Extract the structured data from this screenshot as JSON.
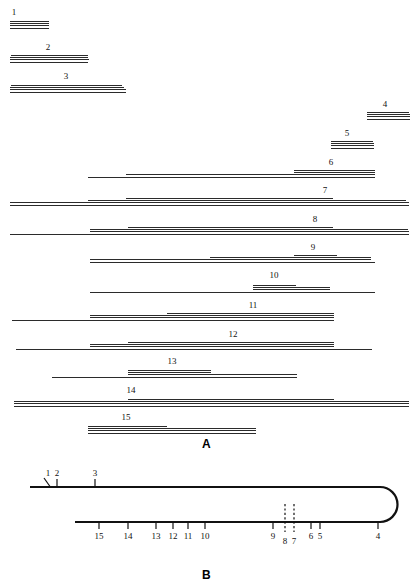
{
  "figure": {
    "panels": [
      {
        "letter": "A",
        "caption_x": 207,
        "caption_y": 437
      },
      {
        "letter": "B",
        "caption_x": 207,
        "caption_y": 568
      }
    ]
  },
  "chart_data": {
    "type": "diagram",
    "xlabel": "",
    "ylabel": "",
    "grid": false,
    "legend": "none",
    "panel_a": {
      "description": "Fifteen restriction fragments, each drawn as a group of four closely spaced horizontal rules of slightly different lengths; the fragment number is printed above each group.",
      "line_color": "#2b2b2b",
      "lines_per_band": 4,
      "bands": [
        {
          "id": "1",
          "label": "1",
          "y": 21,
          "label_x": 14,
          "label_y": 8,
          "rules": [
            {
              "x1": 10,
              "x2": 49
            },
            {
              "x1": 10,
              "x2": 49
            },
            {
              "x1": 10,
              "x2": 49
            },
            {
              "x1": 10,
              "x2": 49
            }
          ]
        },
        {
          "id": "2",
          "label": "2",
          "y": 55,
          "label_x": 48,
          "label_y": 43,
          "rules": [
            {
              "x1": 11,
              "x2": 88
            },
            {
              "x1": 10,
              "x2": 88
            },
            {
              "x1": 10,
              "x2": 89
            },
            {
              "x1": 10,
              "x2": 88
            }
          ]
        },
        {
          "id": "3",
          "label": "3",
          "y": 85,
          "label_x": 66,
          "label_y": 72,
          "rules": [
            {
              "x1": 11,
              "x2": 122
            },
            {
              "x1": 10,
              "x2": 124
            },
            {
              "x1": 10,
              "x2": 126
            },
            {
              "x1": 10,
              "x2": 126
            }
          ]
        },
        {
          "id": "4",
          "label": "4",
          "y": 112,
          "label_x": 385,
          "label_y": 100,
          "rules": [
            {
              "x1": 367,
              "x2": 409
            },
            {
              "x1": 367,
              "x2": 410
            },
            {
              "x1": 367,
              "x2": 410
            },
            {
              "x1": 367,
              "x2": 410
            }
          ]
        },
        {
          "id": "5",
          "label": "5",
          "y": 141,
          "label_x": 347,
          "label_y": 129,
          "rules": [
            {
              "x1": 331,
              "x2": 373
            },
            {
              "x1": 331,
              "x2": 374
            },
            {
              "x1": 331,
              "x2": 374
            },
            {
              "x1": 331,
              "x2": 374
            }
          ]
        },
        {
          "id": "6",
          "label": "6",
          "y": 170,
          "label_x": 331,
          "label_y": 158,
          "rules": [
            {
              "x1": 294,
              "x2": 375
            },
            {
              "x1": 294,
              "x2": 375
            },
            {
              "x1": 126,
              "x2": 375
            },
            {
              "x1": 88,
              "x2": 375
            }
          ]
        },
        {
          "id": "7",
          "label": "7",
          "y": 198,
          "label_x": 325,
          "label_y": 186,
          "rules": [
            {
              "x1": 126,
              "x2": 333
            },
            {
              "x1": 88,
              "x2": 406
            },
            {
              "x1": 10,
              "x2": 409
            },
            {
              "x1": 10,
              "x2": 409
            }
          ]
        },
        {
          "id": "8",
          "label": "8",
          "y": 227,
          "label_x": 315,
          "label_y": 215,
          "rules": [
            {
              "x1": 128,
              "x2": 333
            },
            {
              "x1": 90,
              "x2": 408
            },
            {
              "x1": 90,
              "x2": 409
            },
            {
              "x1": 10,
              "x2": 409
            }
          ]
        },
        {
          "id": "9",
          "label": "9",
          "y": 255,
          "label_x": 313,
          "label_y": 243,
          "rules": [
            {
              "x1": 294,
              "x2": 337
            },
            {
              "x1": 210,
              "x2": 371
            },
            {
              "x1": 90,
              "x2": 371
            },
            {
              "x1": 90,
              "x2": 375
            }
          ]
        },
        {
          "id": "10",
          "label": "10",
          "y": 285,
          "label_x": 274,
          "label_y": 271,
          "rules": [
            {
              "x1": 253,
              "x2": 296
            },
            {
              "x1": 253,
              "x2": 330
            },
            {
              "x1": 253,
              "x2": 330
            },
            {
              "x1": 90,
              "x2": 375
            }
          ]
        },
        {
          "id": "11",
          "label": "11",
          "y": 313,
          "label_x": 253,
          "label_y": 301,
          "rules": [
            {
              "x1": 167,
              "x2": 334
            },
            {
              "x1": 90,
              "x2": 334
            },
            {
              "x1": 90,
              "x2": 334
            },
            {
              "x1": 12,
              "x2": 334
            }
          ]
        },
        {
          "id": "12",
          "label": "12",
          "y": 342,
          "label_x": 233,
          "label_y": 330,
          "rules": [
            {
              "x1": 128,
              "x2": 334
            },
            {
              "x1": 90,
              "x2": 334
            },
            {
              "x1": 90,
              "x2": 334
            },
            {
              "x1": 16,
              "x2": 372
            }
          ]
        },
        {
          "id": "13",
          "label": "13",
          "y": 370,
          "label_x": 172,
          "label_y": 357,
          "rules": [
            {
              "x1": 128,
              "x2": 211
            },
            {
              "x1": 128,
              "x2": 211
            },
            {
              "x1": 128,
              "x2": 297
            },
            {
              "x1": 52,
              "x2": 297
            }
          ]
        },
        {
          "id": "14",
          "label": "14",
          "y": 399,
          "label_x": 131,
          "label_y": 386,
          "rules": [
            {
              "x1": 128,
              "x2": 334
            },
            {
              "x1": 14,
              "x2": 409
            },
            {
              "x1": 14,
              "x2": 409
            },
            {
              "x1": 14,
              "x2": 409
            }
          ]
        },
        {
          "id": "15",
          "label": "15",
          "y": 426,
          "label_x": 126,
          "label_y": 413,
          "rules": [
            {
              "x1": 88,
              "x2": 167
            },
            {
              "x1": 88,
              "x2": 256
            },
            {
              "x1": 88,
              "x2": 256
            },
            {
              "x1": 88,
              "x2": 256
            }
          ]
        }
      ]
    },
    "panel_b": {
      "description": "Hairpin-shaped duplex: an upper strand running left-to-right, a 180-degree turn at the right end, and a lower strand running back to the left. Tick marks mark the numbered restriction sites.",
      "stroke_color": "#111111",
      "top_strand": {
        "x_start": 30,
        "x_end": 380,
        "y": 32
      },
      "bottom_strand": {
        "x_start": 75,
        "x_end": 380,
        "y": 67
      },
      "loop": {
        "center_x": 380,
        "radius_y": 17.5
      },
      "top_sites": [
        {
          "label": "1",
          "x": 48,
          "kind": "pointer"
        },
        {
          "label": "2",
          "x": 57,
          "kind": "tick"
        },
        {
          "label": "3",
          "x": 95,
          "kind": "tick"
        }
      ],
      "bottom_sites": [
        {
          "label": "15",
          "x": 99,
          "kind": "tick"
        },
        {
          "label": "14",
          "x": 128,
          "kind": "tick"
        },
        {
          "label": "13",
          "x": 156,
          "kind": "tick"
        },
        {
          "label": "12",
          "x": 173,
          "kind": "tick"
        },
        {
          "label": "11",
          "x": 188,
          "kind": "tick"
        },
        {
          "label": "10",
          "x": 205,
          "kind": "tick"
        },
        {
          "label": "9",
          "x": 273,
          "kind": "tick"
        },
        {
          "label": "8",
          "x": 285,
          "kind": "dashed"
        },
        {
          "label": "7",
          "x": 294,
          "kind": "dashed"
        },
        {
          "label": "6",
          "x": 311,
          "kind": "tick"
        },
        {
          "label": "5",
          "x": 320,
          "kind": "tick"
        },
        {
          "label": "4",
          "x": 378,
          "kind": "tick"
        }
      ]
    }
  }
}
